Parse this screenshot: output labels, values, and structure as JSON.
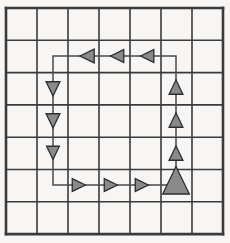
{
  "figure": {
    "background_color": "#f7f6f4",
    "canvas": {
      "width": 230,
      "height": 243
    }
  },
  "grid": {
    "name": "square-grid",
    "columns": 7,
    "rows": 7,
    "origin_x": 6,
    "origin_y": 8,
    "cell_width": 31,
    "cell_height": 32.3,
    "line_color": "#3b3b3b",
    "inner_line_width": 1.6,
    "border_line_width": 2.6,
    "x_lines": [
      6,
      37,
      68,
      99,
      130,
      161,
      192,
      223
    ],
    "y_lines": [
      8,
      40.3,
      72.6,
      104.9,
      137.2,
      169.5,
      201.8,
      234.1
    ]
  },
  "path": {
    "name": "loop-path",
    "stroke_color": "#4a4a4a",
    "stroke_width": 1.5,
    "shape": "rectangle-loop",
    "points": [
      {
        "x": 53,
        "y": 56
      },
      {
        "x": 176,
        "y": 56
      },
      {
        "x": 176,
        "y": 185
      },
      {
        "x": 53,
        "y": 185
      }
    ],
    "description": "Counter-clockwise closed rectangular loop spanning from column 2 to column 6 and row 2 to row 6"
  },
  "arrows": {
    "fill_color": "#8a8a8a",
    "stroke_color": "#2e2e2e",
    "stroke_width": 1.3,
    "items": [
      {
        "id": "top-left-1",
        "direction": "left",
        "cx": 88,
        "cy": 56,
        "size": 13,
        "segment": "top",
        "label": "left-arrow"
      },
      {
        "id": "top-left-2",
        "direction": "left",
        "cx": 118,
        "cy": 56,
        "size": 12,
        "segment": "top",
        "label": "left-arrow"
      },
      {
        "id": "top-left-3",
        "direction": "left",
        "cx": 148,
        "cy": 56,
        "size": 12,
        "segment": "top",
        "label": "left-arrow"
      },
      {
        "id": "left-down-1",
        "direction": "down",
        "cx": 53,
        "cy": 88,
        "size": 13,
        "segment": "left",
        "label": "down-arrow"
      },
      {
        "id": "left-down-2",
        "direction": "down",
        "cx": 53,
        "cy": 120,
        "size": 13,
        "segment": "left",
        "label": "down-arrow"
      },
      {
        "id": "left-down-3",
        "direction": "down",
        "cx": 53,
        "cy": 152,
        "size": 12,
        "segment": "left",
        "label": "down-arrow"
      },
      {
        "id": "bottom-right-1",
        "direction": "right",
        "cx": 78,
        "cy": 185,
        "size": 12,
        "segment": "bottom",
        "label": "right-arrow"
      },
      {
        "id": "bottom-right-2",
        "direction": "right",
        "cx": 110,
        "cy": 185,
        "size": 12,
        "segment": "bottom",
        "label": "right-arrow"
      },
      {
        "id": "bottom-right-3",
        "direction": "right",
        "cx": 141,
        "cy": 185,
        "size": 12,
        "segment": "bottom",
        "label": "right-arrow"
      },
      {
        "id": "right-up-large",
        "direction": "up",
        "cx": 176,
        "cy": 182,
        "size": 25,
        "segment": "right",
        "label": "up-arrow-large"
      },
      {
        "id": "right-up-3",
        "direction": "up",
        "cx": 176,
        "cy": 154,
        "size": 13,
        "segment": "right",
        "label": "up-arrow"
      },
      {
        "id": "right-up-2",
        "direction": "up",
        "cx": 176,
        "cy": 121,
        "size": 13,
        "segment": "right",
        "label": "up-arrow"
      },
      {
        "id": "right-up-1",
        "direction": "up",
        "cx": 176,
        "cy": 88,
        "size": 13,
        "segment": "right",
        "label": "up-arrow"
      }
    ]
  }
}
